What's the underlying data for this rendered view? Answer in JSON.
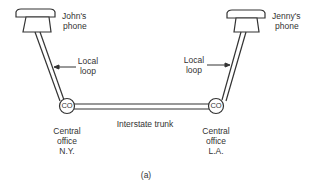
{
  "diagram": {
    "figure_label": "(a)",
    "nodes": {
      "john_phone": {
        "label_line1": "John's",
        "label_line2": "phone"
      },
      "jenny_phone": {
        "label_line1": "Jenny's",
        "label_line2": "phone"
      },
      "co_ny": {
        "symbol": "CO",
        "label_line1": "Central",
        "label_line2": "office",
        "label_line3": "N.Y."
      },
      "co_la": {
        "symbol": "CO",
        "label_line1": "Central",
        "label_line2": "office",
        "label_line3": "L.A."
      }
    },
    "links": {
      "left_loop": {
        "label_line1": "Local",
        "label_line2": "loop"
      },
      "right_loop": {
        "label_line1": "Local",
        "label_line2": "loop"
      },
      "trunk": {
        "label": "Interstate trunk"
      }
    },
    "colors": {
      "stroke": "#333333",
      "background": "#ffffff"
    }
  }
}
